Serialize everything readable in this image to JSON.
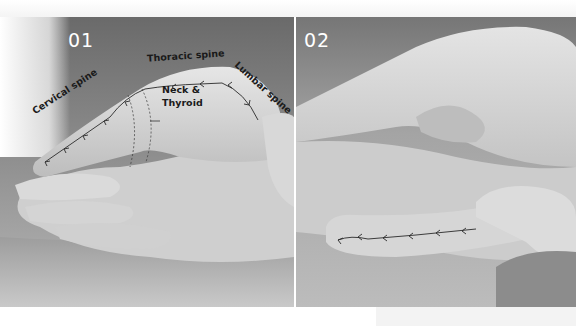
{
  "figure": {
    "panels": [
      {
        "id": "01",
        "number_label": "01",
        "labels": {
          "cervical": "Cervical spine",
          "thoracic": "Thoracic spine",
          "lumbar": "Lumbar spine",
          "neck_line1": "Neck &",
          "neck_line2": "Thyroid"
        }
      },
      {
        "id": "02",
        "number_label": "02"
      }
    ],
    "colors": {
      "background": "#ffffff",
      "photo_dark": "#6e6e6e",
      "skin_light": "#d8d8d8",
      "label_text": "#1a1a1a",
      "number_text": "#ffffff",
      "arrow_line": "#2a2a2a"
    }
  }
}
